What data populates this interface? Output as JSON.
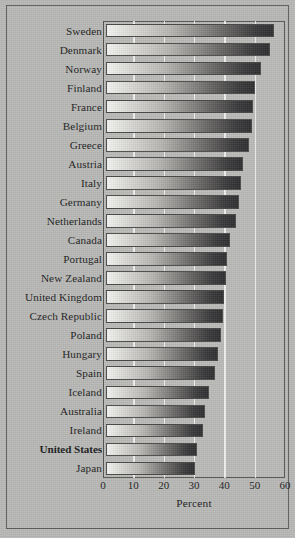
{
  "chart_data": {
    "type": "bar",
    "orientation": "horizontal",
    "title": "",
    "xlabel": "Percent",
    "ylabel": "",
    "xlim": [
      0,
      60
    ],
    "xticks": [
      0,
      10,
      20,
      30,
      40,
      50,
      60
    ],
    "grid": true,
    "legend": null,
    "highlight_category": "United States",
    "categories": [
      "Sweden",
      "Denmark",
      "Norway",
      "Finland",
      "France",
      "Belgium",
      "Greece",
      "Austria",
      "Italy",
      "Germany",
      "Netherlands",
      "Canada",
      "Portugal",
      "New Zealand",
      "United Kingdom",
      "Czech Republic",
      "Poland",
      "Hungary",
      "Spain",
      "Iceland",
      "Australia",
      "Ireland",
      "United States",
      "Japan"
    ],
    "values": [
      55.5,
      54.0,
      51.0,
      49.0,
      48.5,
      48.0,
      47.0,
      45.0,
      44.5,
      44.0,
      43.0,
      41.0,
      40.0,
      39.5,
      39.0,
      38.5,
      38.0,
      37.0,
      36.0,
      34.0,
      32.5,
      32.0,
      30.0,
      29.5
    ]
  },
  "axis": {
    "tick_labels": [
      "0",
      "10",
      "20",
      "30",
      "40",
      "50",
      "60"
    ],
    "x_title": "Percent"
  }
}
